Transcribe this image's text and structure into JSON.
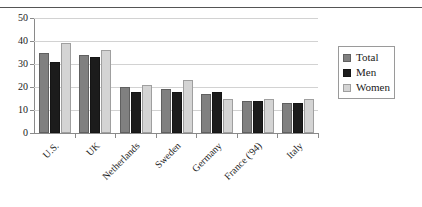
{
  "chart_data": {
    "type": "bar",
    "title": "",
    "xlabel": "",
    "ylabel": "",
    "ylim": [
      0,
      50
    ],
    "yticks": [
      0,
      10,
      20,
      30,
      40,
      50
    ],
    "grid": true,
    "legend_position": "right",
    "categories": [
      "U.S.",
      "UK",
      "Netherlands",
      "Sweden",
      "Germany",
      "France ('94)",
      "Italy"
    ],
    "series": [
      {
        "name": "Total",
        "color": "#808080",
        "values": [
          35,
          34,
          20,
          19,
          17,
          14,
          13
        ]
      },
      {
        "name": "Men",
        "color": "#1c1c1c",
        "values": [
          31,
          33,
          18,
          18,
          18,
          14,
          13
        ]
      },
      {
        "name": "Women",
        "color": "#d4d4d4",
        "values": [
          39,
          36,
          21,
          23,
          15,
          15,
          15
        ]
      }
    ]
  },
  "legend": {
    "items": [
      {
        "label": "Total"
      },
      {
        "label": "Men"
      },
      {
        "label": "Women"
      }
    ]
  }
}
